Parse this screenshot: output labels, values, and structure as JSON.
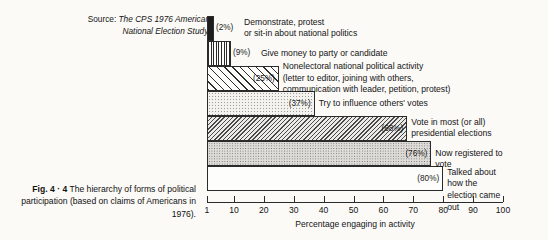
{
  "source_note": {
    "label": "Source:",
    "text": "The CPS 1976 American National Election Study."
  },
  "caption": {
    "figure_number": "Fig. 4 · 4",
    "text": " The hierarchy of forms of political participation (based on claims of Americans in 1976)."
  },
  "chart_data": {
    "type": "bar",
    "orientation": "horizontal",
    "title": "The hierarchy of forms of political participation",
    "xlabel": "Percentage engaging in activity",
    "ylabel": "",
    "xlim": [
      1,
      100
    ],
    "grid": false,
    "legend": "none",
    "xticks": [
      1,
      10,
      20,
      30,
      40,
      50,
      60,
      70,
      80,
      90,
      100
    ],
    "xticklabels": [
      "1",
      "10",
      "20",
      "30",
      "40",
      "50",
      "60",
      "70",
      "80",
      "90",
      "100"
    ],
    "categories": [
      "Demonstrate, protest or sit-in about national politics",
      "Give money to party or candidate",
      "Nonelectoral national political activity (letter to editor, joining with others, communication with leader, petition, protest)",
      "Try to influence others' votes",
      "Vote in most (or all) presidential elections",
      "Now registered to vote",
      "Talked about how the election came out"
    ],
    "values": [
      2,
      9,
      25,
      37,
      68,
      76,
      80
    ],
    "value_labels": [
      "(2%)",
      "(9%)",
      "(25%)",
      "(37%)",
      "(68%)",
      "(76%)",
      "(80%)"
    ],
    "bars": [
      {
        "label": "Demonstrate, protest\nor sit-in about national politics",
        "value": 2,
        "value_label": "(2%)",
        "pattern": "solid-black"
      },
      {
        "label": "Give money to party or candidate",
        "value": 9,
        "value_label": "(9%)",
        "pattern": "vertical-hatch"
      },
      {
        "label": "Nonelectoral national political activity\n(letter to editor, joining with others,\ncommunication with leader, petition, protest)",
        "value": 25,
        "value_label": "(25%)",
        "pattern": "diagonal-hatch"
      },
      {
        "label": "Try to influence others' votes",
        "value": 37,
        "value_label": "(37%)",
        "pattern": "light-dots"
      },
      {
        "label": "Vote in most (or all)\npresidential elections",
        "value": 68,
        "value_label": "(68%)",
        "pattern": "dense-diagonal-hatch"
      },
      {
        "label": "Now registered to vote",
        "value": 76,
        "value_label": "(76%)",
        "pattern": "medium-dots"
      },
      {
        "label": "Talked about how the\nelection came out",
        "value": 80,
        "value_label": "(80%)",
        "pattern": "white"
      }
    ]
  },
  "colors": {
    "page_background": "#fbfaf7",
    "ink": "#1a1a1a",
    "bar_outline": "#2b2b2b"
  }
}
